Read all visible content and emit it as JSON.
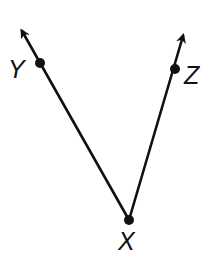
{
  "diagram": {
    "type": "angle",
    "stroke_color": "#111111",
    "background": "#ffffff",
    "vertex": {
      "label": "X",
      "x": 129,
      "y": 220
    },
    "rays": [
      {
        "name": "ray-XY",
        "from": "X",
        "through": {
          "label": "Y",
          "x": 40,
          "y": 63
        },
        "arrow_tip": {
          "x": 21,
          "y": 30
        }
      },
      {
        "name": "ray-XZ",
        "from": "X",
        "through": {
          "label": "Z",
          "x": 175,
          "y": 69
        },
        "arrow_tip": {
          "x": 184,
          "y": 35
        }
      }
    ],
    "labels": {
      "y": "Y",
      "z": "Z",
      "x": "X"
    }
  }
}
